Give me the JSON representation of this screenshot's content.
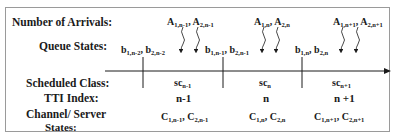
{
  "row_labels": {
    "arrivals": "Number of Arrivals:",
    "queue": "Queue States:",
    "scheduled": "Scheduled Class:",
    "tti": "TTI Index:",
    "channel_line1": "Channel/ Server",
    "channel_line2": "States:"
  },
  "periods": [
    {
      "arrivals": {
        "a1": "A",
        "a1_sub": "1,n-1",
        "sep": ", ",
        "a2": "A",
        "a2_sub": "2,n-1"
      },
      "queue": {
        "b1": "b",
        "b1_sub": "1,n-2",
        "sep": ", ",
        "b2": "b",
        "b2_sub": "2,n-2"
      },
      "scheduled": {
        "sc": "sc",
        "sc_sub": "n-1"
      },
      "tti": "n-1",
      "channel": {
        "c1": "C",
        "c1_sub": "1,n-1",
        "sep": ", ",
        "c2": "C",
        "c2_sub": "2,n-1"
      }
    },
    {
      "arrivals": {
        "a1": "A",
        "a1_sub": "1,n",
        "sep": ", ",
        "a2": "A",
        "a2_sub": "2,n"
      },
      "queue": {
        "b1": "b",
        "b1_sub": "1,n-1",
        "sep": ", ",
        "b2": "b",
        "b2_sub": "2,n-1"
      },
      "scheduled": {
        "sc": "sc",
        "sc_sub": "n"
      },
      "tti": "n",
      "channel": {
        "c1": "C",
        "c1_sub": "1,n",
        "sep": ", ",
        "c2": "C",
        "c2_sub": "2,n"
      }
    },
    {
      "arrivals": {
        "a1": "A",
        "a1_sub": "1,n+1",
        "sep": ", ",
        "a2": "A",
        "a2_sub": "2,n+1"
      },
      "queue": {
        "b1": "b",
        "b1_sub": "1,n",
        "sep": ", ",
        "b2": "b",
        "b2_sub": "2,n"
      },
      "scheduled": {
        "sc": "sc",
        "sc_sub": "n+1"
      },
      "tti": "n +1",
      "channel": {
        "c1": "C",
        "c1_sub": "1,n+1",
        "sep": ", ",
        "c2": "C",
        "c2_sub": "2,n+1"
      }
    }
  ],
  "colors": {
    "line": "#1a1a1a",
    "border": "#9a9a9a"
  }
}
